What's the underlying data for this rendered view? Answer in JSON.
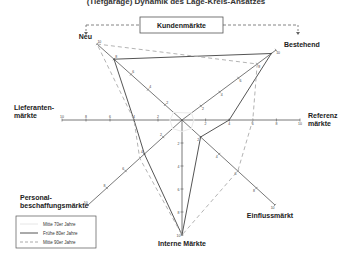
{
  "chart_data": {
    "type": "radar",
    "title": "(Tiefgarage) Dynamik des Lage-Kreis-Ansatzes",
    "top_box_label": "Kundenmärkte",
    "range": [
      0,
      10
    ],
    "ticks": [
      2,
      4,
      6,
      8,
      10
    ],
    "axes": [
      {
        "key": "neu",
        "label": "Neu"
      },
      {
        "key": "bestehend",
        "label": "Bestehend"
      },
      {
        "key": "referenz",
        "label": "Referenz märkte",
        "label_lines": [
          "Referenz",
          "märkte"
        ]
      },
      {
        "key": "einfluss",
        "label": "Einflussmärkt"
      },
      {
        "key": "intern",
        "label": "Interne Märkte"
      },
      {
        "key": "personal",
        "label": "Personal- beschaffungsmärkte",
        "label_lines": [
          "Personal-",
          "beschaffungsmärkte"
        ]
      },
      {
        "key": "lieferanten",
        "label": "Lieferanten- märkte",
        "label_lines": [
          "Lieferanten-",
          "märkte"
        ]
      }
    ],
    "series": [
      {
        "name": "Mitte 70er Jahre",
        "style": "faint",
        "color": "#e6e6e6",
        "values": [
          1,
          1,
          1,
          1,
          1,
          1,
          1
        ]
      },
      {
        "name": "Frühe 80er Jahre",
        "style": "solid",
        "color": "#555555",
        "values": [
          8,
          9.5,
          4,
          2,
          10,
          4,
          4
        ]
      },
      {
        "name": "Mitte 90er Jahre",
        "style": "dashed",
        "color": "#aaaaaa",
        "values": [
          10,
          8,
          6,
          6,
          10,
          4.5,
          4
        ]
      }
    ],
    "legend_position": "bottom-left"
  }
}
